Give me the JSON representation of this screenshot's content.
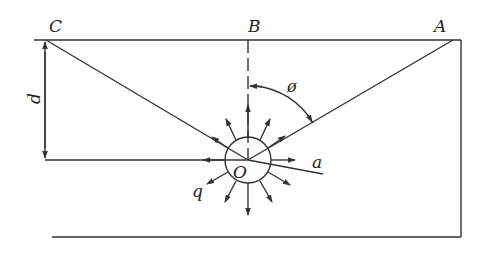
{
  "diagram": {
    "labels": {
      "C": "C",
      "B": "B",
      "A": "A",
      "d": "d",
      "phi": "ø",
      "O": "O",
      "a": "a",
      "q": "q"
    },
    "colors": {
      "stroke": "#333333",
      "background": "#ffffff"
    }
  }
}
